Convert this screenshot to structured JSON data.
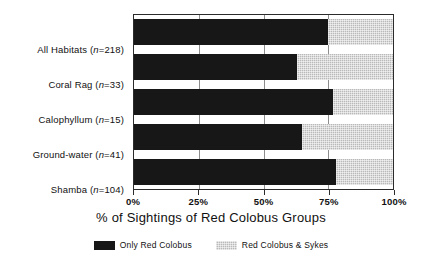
{
  "chart_data": {
    "type": "bar",
    "orientation": "horizontal",
    "stacked": true,
    "title": "",
    "xlabel": "% of Sightings of Red Colobus Groups",
    "ylabel": "",
    "xlim": [
      0,
      100
    ],
    "xticks": [
      0,
      25,
      50,
      75,
      100
    ],
    "xticklabels": [
      "0%",
      "25%",
      "50%",
      "75%",
      "100%"
    ],
    "grid": true,
    "grid_axis": "x",
    "legend_position": "bottom-center",
    "categories": [
      "All Habitats (n=218)",
      "Coral Rag (n=33)",
      "Calophyllum (n=15)",
      "Ground-water (n=41)",
      "Shamba (n=104)"
    ],
    "category_parts": [
      {
        "name": "All Habitats",
        "n_prefix": "(",
        "n_italic": "n",
        "n_value": "=218)"
      },
      {
        "name": "Coral Rag",
        "n_prefix": "(",
        "n_italic": "n",
        "n_value": "=33)"
      },
      {
        "name": "Calophyllum",
        "n_prefix": "(",
        "n_italic": "n",
        "n_value": "=15)"
      },
      {
        "name": "Ground-water",
        "n_prefix": "(",
        "n_italic": "n",
        "n_value": "=41)"
      },
      {
        "name": "Shamba",
        "n_prefix": "(",
        "n_italic": "n",
        "n_value": "=104)"
      }
    ],
    "series": [
      {
        "name": "Only Red Colobus",
        "color": "#171717",
        "values": [
          75,
          63,
          77,
          65,
          78
        ]
      },
      {
        "name": "Red Colobus & Sykes",
        "color": "#b9b9b9",
        "values": [
          25,
          37,
          23,
          35,
          22
        ]
      }
    ]
  },
  "legend": {
    "items": [
      {
        "label": "Only Red Colobus",
        "swatch": "black-solid"
      },
      {
        "label": "Red Colobus & Sykes",
        "swatch": "gray-stipple"
      }
    ]
  },
  "colors": {
    "series_only_red_colobus": "#171717",
    "series_red_colobus_and_sykes": "#b9b9b9",
    "axis": "#2b2b2b",
    "gridline": "#8d8d8d",
    "background": "#ffffff",
    "text": "#111111"
  }
}
